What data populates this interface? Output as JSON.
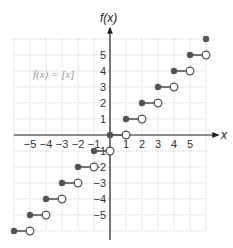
{
  "chart_data": {
    "type": "scatter",
    "title": "",
    "function_label": "f(x) = [x]",
    "xlabel": "x",
    "ylabel": "f(x)",
    "xlim": [
      -6,
      6
    ],
    "ylim": [
      -6,
      6
    ],
    "grid": true,
    "grid_style": "dotted",
    "x_ticks": [
      -5,
      -4,
      -3,
      -2,
      -1,
      1,
      2,
      3,
      4,
      5
    ],
    "y_ticks": [
      5,
      4,
      3,
      2,
      1,
      -1,
      -2,
      -3,
      -4,
      -5
    ],
    "x_tick_labels": [
      "−5",
      "−4",
      "−3",
      "−2",
      "−1",
      "1",
      "2",
      "3",
      "4",
      "5"
    ],
    "y_tick_labels": [
      "5",
      "4",
      "3",
      "2",
      "1",
      "−1",
      "−2",
      "−3",
      "−4",
      "−5"
    ],
    "segments": [
      {
        "x_start": -6,
        "x_end": -5,
        "y": -6,
        "closed_start": true,
        "open_end": true
      },
      {
        "x_start": -5,
        "x_end": -4,
        "y": -5,
        "closed_start": true,
        "open_end": true
      },
      {
        "x_start": -4,
        "x_end": -3,
        "y": -4,
        "closed_start": true,
        "open_end": true
      },
      {
        "x_start": -3,
        "x_end": -2,
        "y": -3,
        "closed_start": true,
        "open_end": true
      },
      {
        "x_start": -2,
        "x_end": -1,
        "y": -2,
        "closed_start": true,
        "open_end": true
      },
      {
        "x_start": -1,
        "x_end": 0,
        "y": -1,
        "closed_start": true,
        "open_end": true
      },
      {
        "x_start": 0,
        "x_end": 1,
        "y": 0,
        "closed_start": true,
        "open_end": true
      },
      {
        "x_start": 1,
        "x_end": 2,
        "y": 1,
        "closed_start": true,
        "open_end": true
      },
      {
        "x_start": 2,
        "x_end": 3,
        "y": 2,
        "closed_start": true,
        "open_end": true
      },
      {
        "x_start": 3,
        "x_end": 4,
        "y": 3,
        "closed_start": true,
        "open_end": true
      },
      {
        "x_start": 4,
        "x_end": 5,
        "y": 4,
        "closed_start": true,
        "open_end": true
      },
      {
        "x_start": 5,
        "x_end": 6,
        "y": 5,
        "closed_start": true,
        "open_end": true
      },
      {
        "x_start": 6,
        "x_end": 6,
        "y": 6,
        "closed_start": true,
        "open_end": false
      }
    ],
    "colors": {
      "segment": "#555555",
      "axis": "#222222",
      "grid": "#bbbbbb",
      "label": "#999999"
    }
  }
}
